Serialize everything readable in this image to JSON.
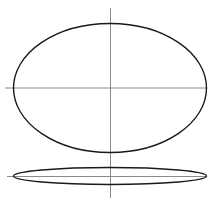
{
  "diagram": {
    "title": "",
    "colors": {
      "outline": "#1a1a1a",
      "axis": "#8a8a8a",
      "background": "#ffffff"
    },
    "vertical_axis": {
      "x": 110.5,
      "y1": 8,
      "y2": 198
    },
    "shapes": [
      {
        "name": "large-ellipse",
        "cx": 110,
        "cy": 88,
        "rx": 96.5,
        "ry": 64.5,
        "horizontal_axis": {
          "y": 88,
          "x1": 5,
          "x2": 207
        }
      },
      {
        "name": "flat-ellipse",
        "cx": 110,
        "cy": 176,
        "rx": 96.5,
        "ry": 8.5,
        "horizontal_axis": {
          "y": 176.5,
          "x1": 7,
          "x2": 207
        }
      }
    ]
  }
}
